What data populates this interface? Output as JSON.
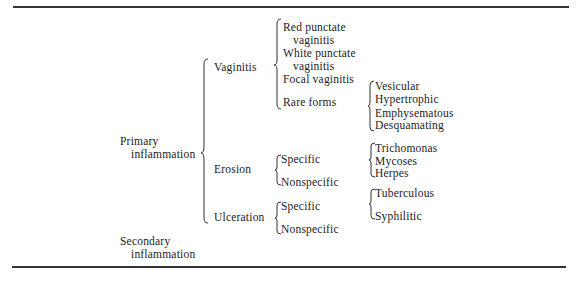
{
  "diagram": {
    "type": "classification-tree",
    "root_items": [
      {
        "label_line1": "Primary",
        "label_line2": "inflammation",
        "children": [
          {
            "label": "Vaginitis",
            "children": [
              {
                "label_line1": "Red punctate",
                "label_line2": "vaginitis"
              },
              {
                "label_line1": "White punctate",
                "label_line2": "vaginitis"
              },
              {
                "label": "Focal vaginitis"
              },
              {
                "label": "Rare forms",
                "children": [
                  "Vesicular",
                  "Hypertrophic",
                  "Emphysematous",
                  "Desquamating"
                ]
              }
            ]
          },
          {
            "label": "Erosion",
            "children": [
              {
                "label": "Specific",
                "children": [
                  "Trichomonas",
                  "Mycoses",
                  "Herpes"
                ]
              },
              {
                "label": "Nonspecific"
              }
            ]
          },
          {
            "label": "Ulceration",
            "children": [
              {
                "label": "Specific",
                "children": [
                  "Tuberculous",
                  "Syphilitic"
                ]
              },
              {
                "label": "Nonspecific"
              }
            ]
          }
        ]
      },
      {
        "label_line1": "Secondary",
        "label_line2": "inflammation"
      }
    ]
  }
}
